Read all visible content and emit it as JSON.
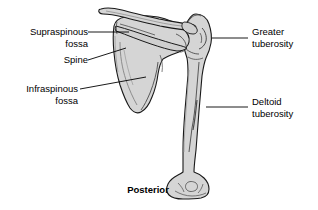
{
  "figure": {
    "orientation_caption": "Posterior",
    "background_color": "#ffffff",
    "bone_fill_color": "#d5d5d5",
    "bone_outline_color": "#1a1a1a",
    "leader_line_color": "#000000",
    "text_color": "#000000"
  },
  "labels": {
    "supraspinous_fossa": "Supraspinous\nfossa",
    "spine": "Spine",
    "infraspinous_fossa": "Infraspinous\nfossa",
    "greater_tuberosity": "Greater\ntuberosity",
    "deltoid_tuberosity": "Deltoid\ntuberosity"
  },
  "structures": [
    {
      "name": "supraspinous-fossa",
      "label": "Supraspinous fossa",
      "side": "left",
      "leader": {
        "x1": 88,
        "y1": 32,
        "x2": 129,
        "y2": 32
      }
    },
    {
      "name": "spine",
      "label": "Spine",
      "side": "left",
      "leader": {
        "x1": 88,
        "y1": 60,
        "x2": 126,
        "y2": 48
      }
    },
    {
      "name": "infraspinous-fossa",
      "label": "Infraspinous fossa",
      "side": "left",
      "leader": {
        "x1": 80,
        "y1": 89,
        "x2": 146,
        "y2": 77
      }
    },
    {
      "name": "greater-tuberosity",
      "label": "Greater tuberosity",
      "side": "right",
      "leader": {
        "x1": 212,
        "y1": 38,
        "x2": 248,
        "y2": 38
      }
    },
    {
      "name": "deltoid-tuberosity",
      "label": "Deltoid tuberosity",
      "side": "right",
      "leader": {
        "x1": 206,
        "y1": 107,
        "x2": 248,
        "y2": 107
      }
    }
  ],
  "bones": [
    {
      "name": "scapula",
      "label": "Scapula"
    },
    {
      "name": "clavicle",
      "label": "Clavicle"
    },
    {
      "name": "humerus",
      "label": "Humerus"
    }
  ]
}
